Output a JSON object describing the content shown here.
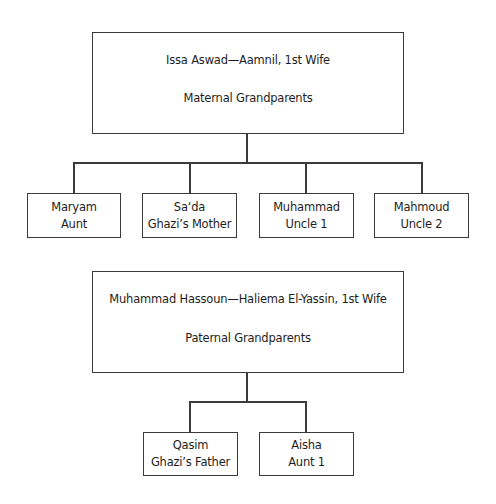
{
  "maternal": {
    "couple": "Issa Aswad—Aamnil, 1st Wife",
    "label": "Maternal Grandparents",
    "children": [
      {
        "name": "Maryam",
        "role": "Aunt"
      },
      {
        "name": "Sa‘da",
        "role": "Ghazi’s Mother"
      },
      {
        "name": "Muhammad",
        "role": "Uncle 1"
      },
      {
        "name": "Mahmoud",
        "role": "Uncle 2"
      }
    ]
  },
  "paternal": {
    "couple": "Muhammad Hassoun—Haliema El-Yassin, 1st Wife",
    "label": "Paternal Grandparents",
    "children": [
      {
        "name": "Qasim",
        "role": "Ghazi’s Father"
      },
      {
        "name": "Aisha",
        "role": "Aunt 1"
      }
    ]
  },
  "colors": {
    "line": "#3a3a3a",
    "text": "#1e1e1e",
    "background": "#ffffff"
  }
}
